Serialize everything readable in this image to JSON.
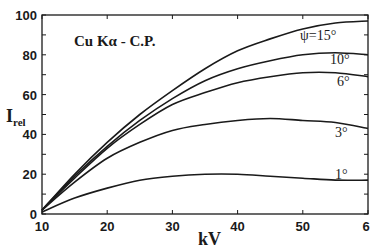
{
  "chart_data": {
    "type": "line",
    "title": "Cu Kα - C.P.",
    "xlabel": "kV",
    "ylabel": "I_rel",
    "ylabel_main": "I",
    "ylabel_sub": "rel",
    "xlim": [
      10,
      60
    ],
    "ylim": [
      0,
      100
    ],
    "x_ticks": [
      10,
      20,
      30,
      40,
      50,
      60
    ],
    "x_tick_labels": [
      "10",
      "20",
      "30",
      "40",
      "50",
      "6"
    ],
    "y_ticks": [
      0,
      20,
      40,
      60,
      80,
      100
    ],
    "y_tick_labels": [
      "0",
      "20",
      "40",
      "60",
      "80",
      "100"
    ],
    "grid": false,
    "legend_position": "inline-right",
    "x": [
      10,
      15,
      20,
      25,
      30,
      35,
      40,
      45,
      50,
      55,
      60
    ],
    "series": [
      {
        "name": "ψ=15°",
        "label": "ψ=15°",
        "values": [
          2,
          20,
          36,
          50,
          62,
          73,
          82,
          88,
          93,
          96,
          97
        ]
      },
      {
        "name": "10°",
        "label": "10°",
        "values": [
          2,
          19,
          34,
          47,
          58,
          67,
          73,
          77,
          80,
          81,
          80
        ]
      },
      {
        "name": "6°",
        "label": "6°",
        "values": [
          2,
          18,
          33,
          45,
          55,
          61,
          66,
          69,
          71,
          71,
          69
        ]
      },
      {
        "name": "3°",
        "label": "3°",
        "values": [
          2,
          16,
          28,
          36,
          42,
          45,
          47,
          48,
          47,
          46,
          43
        ]
      },
      {
        "name": "1°",
        "label": "1°",
        "values": [
          1,
          8,
          13,
          17,
          19,
          20,
          20,
          19,
          18,
          17,
          17
        ]
      }
    ]
  }
}
